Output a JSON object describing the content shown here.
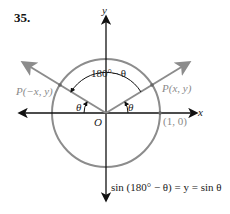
{
  "problem_number": "35.",
  "axes": {
    "x_label": "x",
    "y_label": "y",
    "origin_label": "O"
  },
  "points": {
    "p_right": "P(x, y)",
    "p_left": "P(−x, y)",
    "unit_point": "(1, 0)"
  },
  "angles": {
    "theta_right": "θ",
    "theta_left": "θ",
    "supplement": "180°− θ"
  },
  "identity": "sin (180° − θ) = y = sin θ",
  "colors": {
    "circle": "#8c8c8c",
    "axes": "#111111",
    "rays": "#8c8c8c"
  }
}
